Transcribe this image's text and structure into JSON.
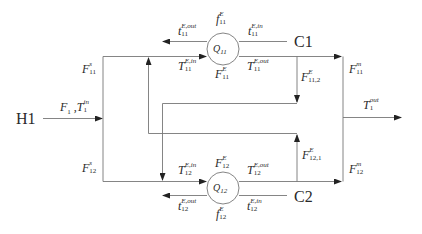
{
  "diagram": {
    "hot_stream": {
      "label": "H1",
      "inlet": {
        "base": "F",
        "sub": "1",
        "sep": " ,",
        "base2": "T",
        "sup2": "in",
        "sub2": "1"
      },
      "outlet": {
        "base": "T",
        "sup": "out",
        "sub": "1"
      }
    },
    "splits": {
      "top": {
        "base": "F",
        "sup": "s",
        "sub": "11"
      },
      "bottom": {
        "base": "F",
        "sup": "s",
        "sub": "12"
      }
    },
    "mixers": {
      "top": {
        "base": "F",
        "sup": "m",
        "sub": "11"
      },
      "bottom": {
        "base": "F",
        "sup": "m",
        "sub": "12"
      }
    },
    "bypasses": {
      "b12": {
        "base": "F",
        "sup": "E",
        "sub": "11,2"
      },
      "b21": {
        "base": "F",
        "sup": "E",
        "sub": "12,1"
      }
    },
    "exchangers": [
      {
        "id": "Q11",
        "label_base": "Q",
        "label_sub": "11",
        "cold_stream": "C1",
        "cold_flow": {
          "base": "f",
          "sup": "E",
          "sub": "11"
        },
        "hot_flow": {
          "base": "F",
          "sup": "E",
          "sub": "11"
        },
        "t_out": {
          "base": "t",
          "sup": "E,out",
          "sub": "11"
        },
        "t_in": {
          "base": "t",
          "sup": "E,in",
          "sub": "11"
        },
        "T_in": {
          "base": "T",
          "sup": "E,in",
          "sub": "11"
        },
        "T_out": {
          "base": "T",
          "sup": "E,out",
          "sub": "11"
        }
      },
      {
        "id": "Q12",
        "label_base": "Q",
        "label_sub": "12",
        "cold_stream": "C2",
        "cold_flow": {
          "base": "f",
          "sup": "E",
          "sub": "12"
        },
        "hot_flow": {
          "base": "F",
          "sup": "E",
          "sub": "12"
        },
        "t_out": {
          "base": "t",
          "sup": "E,out",
          "sub": "12"
        },
        "t_in": {
          "base": "t",
          "sup": "E,in",
          "sub": "12"
        },
        "T_in": {
          "base": "T",
          "sup": "E,in",
          "sub": "12"
        },
        "T_out": {
          "base": "T",
          "sup": "E,out",
          "sub": "12"
        }
      }
    ],
    "colors": {
      "line": "#555555",
      "text": "#2a2a2a",
      "background": "#ffffff"
    }
  }
}
